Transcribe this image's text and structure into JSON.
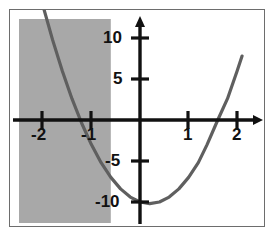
{
  "figure": {
    "title": "",
    "background_color": "#ffffff",
    "frame_color": "#6d6d6d",
    "axis_color": "#111111",
    "curve_color": "#5f5f5f",
    "shading_color": "#a8a8a8"
  },
  "chart_data": {
    "type": "line",
    "title": "",
    "xlabel": "",
    "ylabel": "",
    "xlim": [
      -2.5,
      2.9
    ],
    "ylim": [
      -12.5,
      12.5
    ],
    "grid": false,
    "legend": "none",
    "x_ticks": [
      -2,
      -1,
      1,
      2
    ],
    "x_tick_labels": [
      "-2",
      "-1",
      "1",
      "2"
    ],
    "y_ticks": [
      10,
      5,
      -5,
      -10
    ],
    "y_tick_labels": [
      "10",
      "5",
      "-5",
      "-10"
    ],
    "series": [
      {
        "name": "parabola",
        "equation": "y = 5x^2 - 2x - 10",
        "color": "#5f5f5f",
        "x": [
          -2.48,
          -2.3,
          -2.1,
          -2.0,
          -1.8,
          -1.6,
          -1.4,
          -1.2,
          -1.0,
          -0.8,
          -0.6,
          -0.4,
          -0.2,
          0.0,
          0.2,
          0.4,
          0.6,
          0.8,
          1.0,
          1.2,
          1.38,
          1.6,
          1.8,
          2.0,
          2.1
        ],
        "y": [
          25.7,
          21.1,
          16.2,
          14.0,
          9.8,
          6.0,
          2.6,
          -0.4,
          -3.0,
          -5.2,
          -7.0,
          -8.4,
          -9.4,
          -10.0,
          -10.2,
          -10.0,
          -9.4,
          -8.4,
          -7.0,
          -5.2,
          -3.0,
          0.0,
          2.6,
          6.0,
          7.8
        ]
      }
    ],
    "annotations": [
      {
        "type": "shaded-region",
        "name": "solution-region",
        "x_range": [
          -2.5,
          -0.6
        ],
        "y_range": [
          -12.5,
          12.5
        ],
        "color": "#a8a8a8",
        "label": ""
      }
    ]
  },
  "axes": {
    "x_axis_name": "x-axis",
    "y_axis_name": "y-axis",
    "x_arrow": "right",
    "y_arrow": "up"
  }
}
